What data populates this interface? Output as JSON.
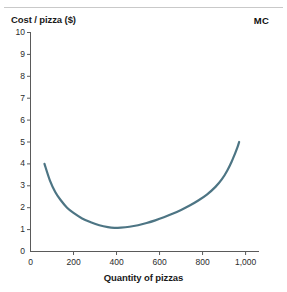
{
  "chart_data": {
    "type": "line",
    "title": "",
    "subtitle": "",
    "xlabel": "Quantity of pizzas",
    "ylabel": "Cost / pizza ($)",
    "series_label": "MC",
    "xlim": [
      0,
      1060
    ],
    "ylim": [
      0,
      10
    ],
    "grid": false,
    "legend_position": "top-right-annotation",
    "x_ticks": [
      0,
      200,
      400,
      600,
      800,
      1000
    ],
    "x_tick_labels": [
      "0",
      "200",
      "400",
      "600",
      "800",
      "1,000"
    ],
    "y_ticks": [
      0,
      1,
      2,
      3,
      4,
      5,
      6,
      7,
      8,
      9,
      10
    ],
    "y_tick_labels": [
      "0",
      "1",
      "2",
      "3",
      "4",
      "5",
      "6",
      "7",
      "8",
      "9",
      "10"
    ],
    "line_color": "#4d7584",
    "line_width": 2.2,
    "series": [
      {
        "name": "MC",
        "x": [
          65,
          90,
          115,
          140,
          170,
          200,
          240,
          280,
          320,
          360,
          390,
          420,
          460,
          500,
          540,
          580,
          620,
          660,
          700,
          740,
          780,
          820,
          860,
          890,
          915,
          935,
          950,
          962,
          970
        ],
        "values": [
          4.0,
          3.25,
          2.72,
          2.35,
          2.0,
          1.76,
          1.51,
          1.34,
          1.2,
          1.11,
          1.08,
          1.09,
          1.13,
          1.2,
          1.3,
          1.42,
          1.56,
          1.72,
          1.9,
          2.1,
          2.33,
          2.6,
          2.95,
          3.3,
          3.7,
          4.1,
          4.45,
          4.75,
          5.0
        ]
      }
    ]
  },
  "axes": {
    "y_axis_name": "cost-axis",
    "x_axis_name": "quantity-axis"
  }
}
